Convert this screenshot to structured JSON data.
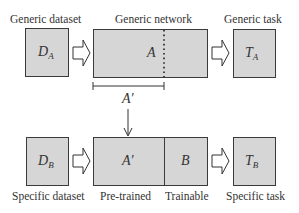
{
  "top_row": {
    "labels": {
      "dataset": "Generic dataset",
      "network": "Generic network",
      "task": "Generic task"
    },
    "dataset_box": {
      "symbol": "D",
      "subscript": "A"
    },
    "network_box": {
      "symbol": "A"
    },
    "task_box": {
      "symbol": "T",
      "subscript": "A"
    }
  },
  "transfer": {
    "bracket_label": "A′"
  },
  "bottom_row": {
    "labels": {
      "dataset": "Specific dataset",
      "pretrained": "Pre-trained",
      "trainable": "Trainable",
      "task": "Specific task"
    },
    "dataset_box": {
      "symbol": "D",
      "subscript": "B"
    },
    "pretrained_box": {
      "symbol": "A′"
    },
    "trainable_box": {
      "symbol": "B"
    },
    "task_box": {
      "symbol": "T",
      "subscript": "B"
    }
  },
  "colors": {
    "box_fill": "#d6d6d6",
    "box_stroke": "#3a3a3a",
    "arrow_fill": "#ffffff"
  }
}
